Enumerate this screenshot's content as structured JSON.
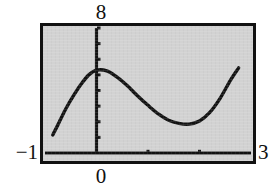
{
  "figure": {
    "kind": "graphing-calculator-plot",
    "background_color": "#ffffff",
    "screen_color": "#d2d2d2",
    "ink_color": "#111111"
  },
  "labels": {
    "y_max": "8",
    "x_min": "−1",
    "x_max": "3",
    "x_origin": "0"
  },
  "chart_data": {
    "type": "line",
    "title": "",
    "subtitle": "",
    "xlabel": "",
    "ylabel": "",
    "xlim": [
      -1,
      3
    ],
    "ylim": [
      0,
      8
    ],
    "grid": false,
    "legend": "none",
    "axis_labels_shown": {
      "top_center": "8",
      "left_of_axis": "-1",
      "right_of_axis": "3",
      "below_origin": "0"
    },
    "x_axis": {
      "position_value": 0,
      "drawn_from": -1,
      "drawn_to": 3,
      "tick_values": [
        1,
        2
      ],
      "tick_labels": []
    },
    "y_axis": {
      "position_value": 0,
      "drawn_from": 0,
      "drawn_to": 8,
      "tick_values": [
        1,
        2,
        3,
        4,
        5,
        6,
        7,
        8
      ],
      "tick_labels": []
    },
    "series": [
      {
        "name": "curve",
        "style": "solid",
        "color": "#111111",
        "width": 3,
        "shape": "cubic",
        "features": {
          "local_maximum": {
            "x": 0.0,
            "y": 5.3
          },
          "local_minimum": {
            "x": 1.68,
            "y": 1.85
          },
          "left_endpoint": {
            "x": -0.85,
            "y": 1.15
          },
          "right_endpoint": {
            "x": 2.76,
            "y": 5.45
          }
        },
        "x": [
          -0.85,
          -0.75,
          -0.6,
          -0.45,
          -0.3,
          -0.15,
          0.0,
          0.2,
          0.4,
          0.6,
          0.8,
          1.0,
          1.2,
          1.4,
          1.6,
          1.8,
          2.0,
          2.2,
          2.4,
          2.6,
          2.76
        ],
        "y": [
          1.15,
          1.8,
          2.8,
          3.65,
          4.4,
          5.0,
          5.3,
          5.25,
          4.85,
          4.3,
          3.65,
          3.05,
          2.5,
          2.1,
          1.9,
          1.85,
          2.05,
          2.6,
          3.5,
          4.65,
          5.45
        ]
      }
    ]
  }
}
